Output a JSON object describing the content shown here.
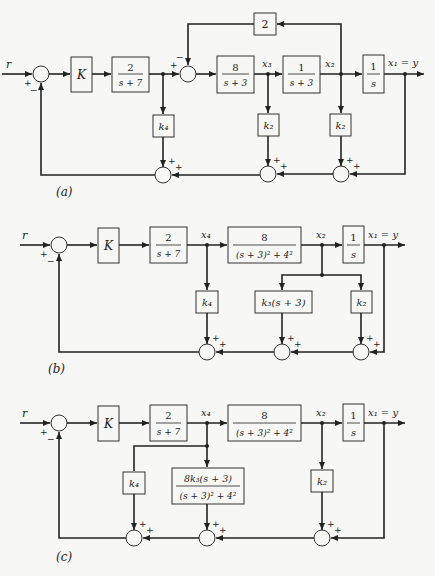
{
  "diagrams": {
    "a": {
      "caption": "(a)",
      "input": "r",
      "output": "x₁ = y",
      "blocks": {
        "gain": "K",
        "actuator_num": "2",
        "actuator_den": "s + 7",
        "g1_num": "8",
        "g1_den": "s + 3",
        "g2_num": "1",
        "g2_den": "s + 3",
        "integrator_num": "1",
        "integrator_den": "s",
        "inner_fb": "2",
        "fb_x4": "k₄",
        "fb_x3": "k₂",
        "fb_x2": "k₂"
      },
      "signals": {
        "x3": "x₃",
        "x2": "x₂"
      }
    },
    "b": {
      "caption": "(b)",
      "input": "r",
      "output": "x₁ = y",
      "blocks": {
        "gain": "K",
        "actuator_num": "2",
        "actuator_den": "s + 7",
        "plant_num": "8",
        "plant_den": "(s + 3)² + 4²",
        "integrator_num": "1",
        "integrator_den": "s",
        "fb_x4": "k₄",
        "fb_k3": "k₃(s + 3)",
        "fb_k2": "k₂"
      },
      "signals": {
        "x4": "x₄",
        "x2": "x₂"
      }
    },
    "c": {
      "caption": "(c)",
      "input": "r",
      "output": "x₁ = y",
      "blocks": {
        "gain": "K",
        "actuator_num": "2",
        "actuator_den": "s + 7",
        "plant_num": "8",
        "plant_den": "(s + 3)² + 4²",
        "integrator_num": "1",
        "integrator_den": "s",
        "fb_x4": "k₄",
        "fb_k3_num": "8k₃(s + 3)",
        "fb_k3_den": "(s + 3)² + 4²",
        "fb_k2": "k₂"
      },
      "signals": {
        "x4": "x₄",
        "x2": "x₂"
      }
    },
    "signs": {
      "plus": "+",
      "minus": "−"
    }
  }
}
